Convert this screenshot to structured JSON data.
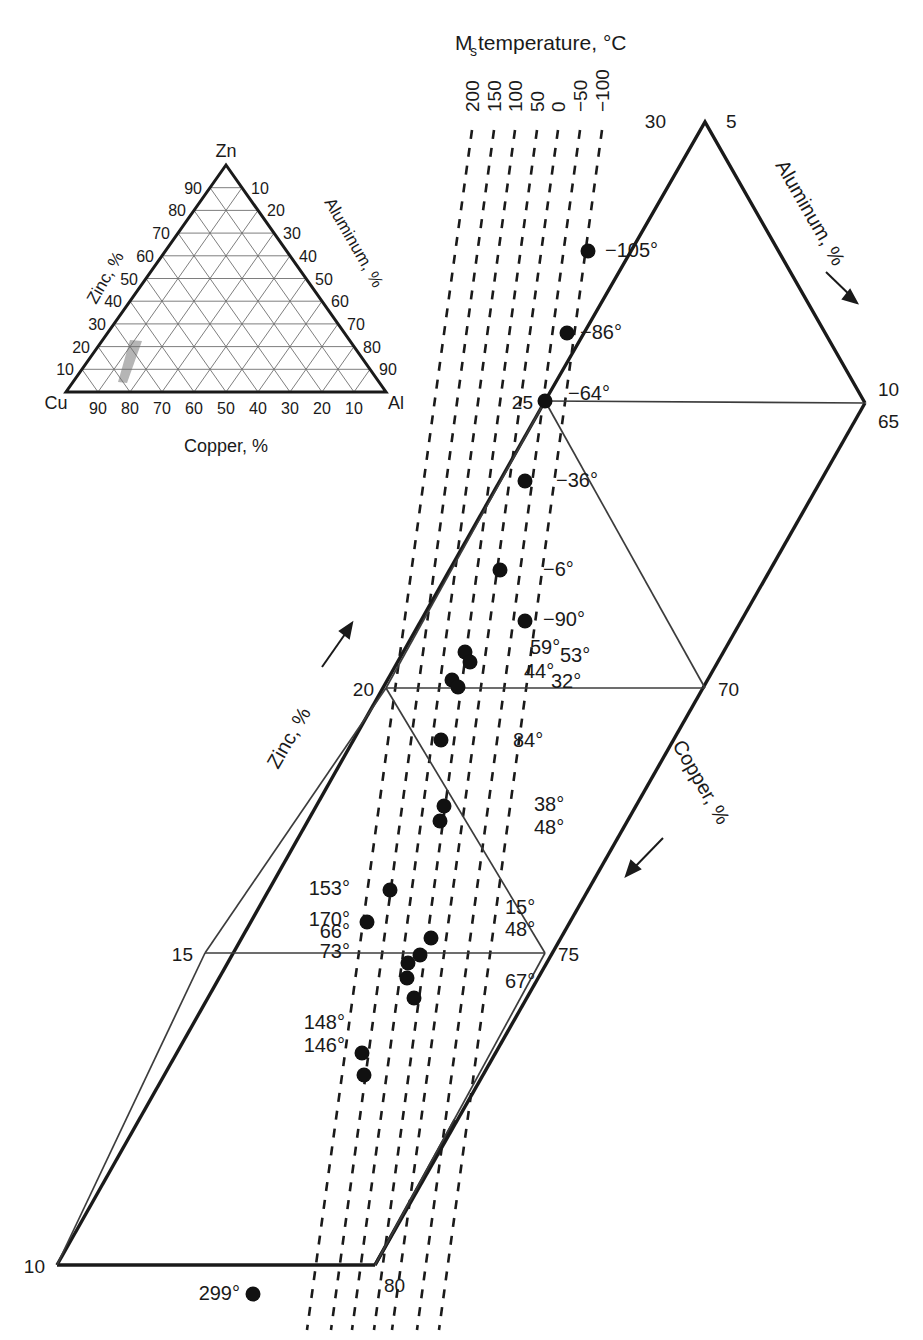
{
  "figure": {
    "title_main": "M",
    "title_sub": "s",
    "title_rest": " temperature, °C"
  },
  "inset": {
    "name": "cu-zn-al-ternary-inset",
    "apex_label": "Zn",
    "left_label": "Cu",
    "right_label": "Al",
    "left_axis_title": "Zinc, %",
    "right_axis_title": "Aluminum, %",
    "bottom_axis_title": "Copper, %",
    "left_ticks": [
      "90",
      "80",
      "70",
      "60",
      "50",
      "40",
      "30",
      "20",
      "10"
    ],
    "right_ticks": [
      "10",
      "20",
      "30",
      "40",
      "50",
      "60",
      "70",
      "80",
      "90"
    ],
    "bottom_ticks": [
      "90",
      "80",
      "70",
      "60",
      "50",
      "40",
      "30",
      "20",
      "10"
    ]
  },
  "axes": {
    "zinc_label": "Zinc, %",
    "copper_label": "Copper, %",
    "aluminum_label": "Aluminum, %"
  },
  "vertex_labels": {
    "top_left": "30",
    "top_right": "5",
    "right_upper": "10",
    "right_lower": "65",
    "mid_left_25": "25",
    "mid_left_20": "20",
    "mid_left_15": "15",
    "mid_left_10": "10",
    "mid_right_70": "70",
    "mid_right_75": "75",
    "bottom_80": "80"
  },
  "chart_data": {
    "type": "scatter",
    "xlabel": "Copper, %",
    "ylabel": "Zinc, %",
    "zlabel": "Aluminum, %",
    "grid": false,
    "legend": "none",
    "iso_lines": {
      "label": "Ms temperature, °C",
      "style": "dashed",
      "values": [
        200,
        150,
        100,
        50,
        0,
        -50,
        -100
      ],
      "tick_labels": [
        "200",
        "150",
        "100",
        "50",
        "0",
        "−50",
        "−100"
      ]
    },
    "points": [
      {
        "label": "−105°",
        "x": 588,
        "y": 251,
        "label_x": 605,
        "label_y": 257,
        "anchor": "start"
      },
      {
        "label": "−86°",
        "x": 567,
        "y": 333,
        "label_x": 580,
        "label_y": 339,
        "anchor": "start"
      },
      {
        "label": "−64°",
        "x": 545,
        "y": 401,
        "label_x": 568,
        "label_y": 400,
        "anchor": "start"
      },
      {
        "label": "−36°",
        "x": 525,
        "y": 481,
        "label_x": 556,
        "label_y": 487,
        "anchor": "start"
      },
      {
        "label": "−6°",
        "x": 500,
        "y": 570,
        "label_x": 543,
        "label_y": 576,
        "anchor": "start"
      },
      {
        "label": "−90°",
        "x": 525,
        "y": 621,
        "label_x": 543,
        "label_y": 626,
        "anchor": "start"
      },
      {
        "label": "59°",
        "x": 465,
        "y": 652,
        "label_x": 530,
        "label_y": 654,
        "anchor": "start"
      },
      {
        "label": "53°",
        "x": 470,
        "y": 662,
        "label_x": 560,
        "label_y": 662,
        "anchor": "start"
      },
      {
        "label": "44°",
        "x": 452,
        "y": 680,
        "label_x": 524,
        "label_y": 678,
        "anchor": "start"
      },
      {
        "label": "32°",
        "x": 458,
        "y": 687,
        "label_x": 551,
        "label_y": 688,
        "anchor": "start"
      },
      {
        "label": "84°",
        "x": 441,
        "y": 740,
        "label_x": 513,
        "label_y": 747,
        "anchor": "start"
      },
      {
        "label": "38°",
        "x": 444,
        "y": 806,
        "label_x": 534,
        "label_y": 811,
        "anchor": "start"
      },
      {
        "label": "48°",
        "x": 440,
        "y": 821,
        "label_x": 534,
        "label_y": 834,
        "anchor": "start"
      },
      {
        "label": "153°",
        "x": 390,
        "y": 890,
        "label_x": 350,
        "label_y": 895,
        "anchor": "end"
      },
      {
        "label": "170°",
        "x": 367,
        "y": 922,
        "label_x": 350,
        "label_y": 926,
        "anchor": "end"
      },
      {
        "label": "15°",
        "x": 431,
        "y": 938,
        "label_x": 505,
        "label_y": 914,
        "anchor": "start"
      },
      {
        "label": "48°",
        "x": 420,
        "y": 955,
        "label_x": 505,
        "label_y": 936,
        "anchor": "start"
      },
      {
        "label": "66°",
        "x": 408,
        "y": 963,
        "label_x": 350,
        "label_y": 938,
        "anchor": "end"
      },
      {
        "label": "73°",
        "x": 407,
        "y": 978,
        "label_x": 350,
        "label_y": 958,
        "anchor": "end"
      },
      {
        "label": "67°",
        "x": 414,
        "y": 998,
        "label_x": 505,
        "label_y": 988,
        "anchor": "start"
      },
      {
        "label": "148°",
        "x": 362,
        "y": 1053,
        "label_x": 345,
        "label_y": 1029,
        "anchor": "end"
      },
      {
        "label": "146°",
        "x": 364,
        "y": 1075,
        "label_x": 345,
        "label_y": 1052,
        "anchor": "end"
      },
      {
        "label": "299°",
        "x": 253,
        "y": 1294,
        "label_x": 240,
        "label_y": 1300,
        "anchor": "end"
      }
    ]
  },
  "colors": {
    "line": "#1a1a1a",
    "thin_line": "#444444",
    "point": "#111111",
    "inset_shade": "#b5b5b5",
    "background": "#ffffff"
  }
}
